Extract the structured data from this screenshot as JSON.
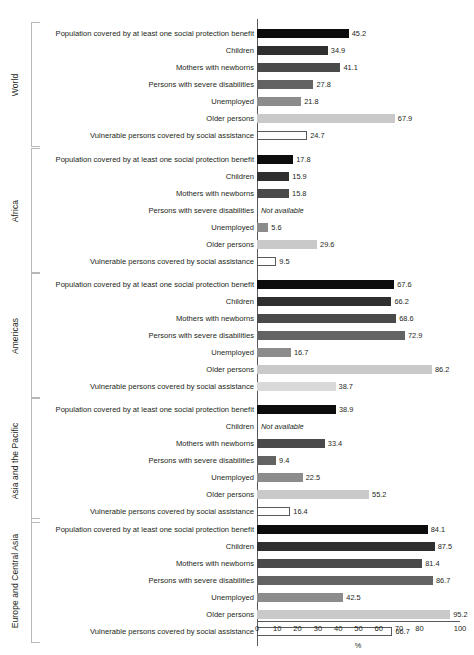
{
  "chart_data": {
    "type": "bar",
    "title": "",
    "subtitle": "",
    "xlabel": "%",
    "ylabel": "",
    "xlim": [
      0,
      100
    ],
    "grid": false,
    "legend": false,
    "orientation": "horizontal",
    "not_available_text": "Not available",
    "xticks": [
      {
        "value": 0,
        "label": "0"
      },
      {
        "value": 10,
        "label": "10"
      },
      {
        "value": 20,
        "label": "20"
      },
      {
        "value": 30,
        "label": "30"
      },
      {
        "value": 40,
        "label": "40"
      },
      {
        "value": 50,
        "label": "50"
      },
      {
        "value": 60,
        "label": "60"
      },
      {
        "value": 70,
        "label": "70"
      },
      {
        "value": 80,
        "label": "80"
      },
      {
        "value": 100,
        "label": "100"
      }
    ],
    "categories": [
      "Population covered by at least one social protection benefit",
      "Children",
      "Mothers with newborns",
      "Persons with severe disabilities",
      "Unemployed",
      "Older persons",
      "Vulnerable persons covered by social assistance"
    ],
    "category_colors": [
      "#0d0d0d",
      "#2f2f2f",
      "#4a4a4a",
      "#636363",
      "#8c8c8c",
      "#c9c9c9",
      "#ffffff"
    ],
    "groups": [
      {
        "name": "World",
        "values": [
          45.2,
          34.9,
          41.1,
          27.8,
          21.8,
          67.9,
          24.7
        ],
        "labels": [
          "45.2",
          "34.9",
          "41.1",
          "27.8",
          "21.8",
          "67.9",
          "24.7"
        ],
        "last_bar_style": "outline"
      },
      {
        "name": "Africa",
        "values": [
          17.8,
          15.9,
          15.8,
          null,
          5.6,
          29.6,
          9.5
        ],
        "labels": [
          "17.8",
          "15.9",
          "15.8",
          "Not available",
          "5.6",
          "29.6",
          "9.5"
        ],
        "last_bar_style": "outline"
      },
      {
        "name": "Americas",
        "values": [
          67.6,
          66.2,
          68.6,
          72.9,
          16.7,
          86.2,
          38.7
        ],
        "labels": [
          "67.6",
          "66.2",
          "68.6",
          "72.9",
          "16.7",
          "86.2",
          "38.7"
        ],
        "last_bar_style": "filled-light"
      },
      {
        "name": "Asia and the Pacific",
        "values": [
          38.9,
          null,
          33.4,
          9.4,
          22.5,
          55.2,
          16.4
        ],
        "labels": [
          "38.9",
          "Not available",
          "33.4",
          "9.4",
          "22.5",
          "55.2",
          "16.4"
        ],
        "last_bar_style": "outline"
      },
      {
        "name": "Europe and Central Asia",
        "values": [
          84.1,
          87.5,
          81.4,
          86.7,
          42.5,
          95.2,
          66.7
        ],
        "labels": [
          "84.1",
          "87.5",
          "81.4",
          "86.7",
          "42.5",
          "95.2",
          "66.7"
        ],
        "last_bar_style": "outline"
      }
    ]
  }
}
